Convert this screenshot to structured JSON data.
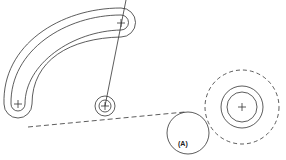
{
  "diagram": {
    "type": "mechanical-drawing",
    "stroke_color": "#333333",
    "background": "#ffffff",
    "labels": {
      "circle_a": "(A)"
    },
    "elements": [
      {
        "name": "curved-slot",
        "description": "Curved slot with rounded ends, two concentric outlines"
      },
      {
        "name": "small-concentric-circles",
        "description": "Small pivot with two concentric circles and center mark"
      },
      {
        "name": "large-concentric-circles",
        "description": "Two solid concentric circles inside a dashed circle, with center mark"
      },
      {
        "name": "circle-a",
        "description": "Circle labelled (A) tangent to dashed circle"
      },
      {
        "name": "radial-line",
        "description": "Line passing through slot end center and small pivot center"
      },
      {
        "name": "dashed-tangent-line",
        "description": "Dashed line from slot outline to circle A"
      }
    ]
  }
}
